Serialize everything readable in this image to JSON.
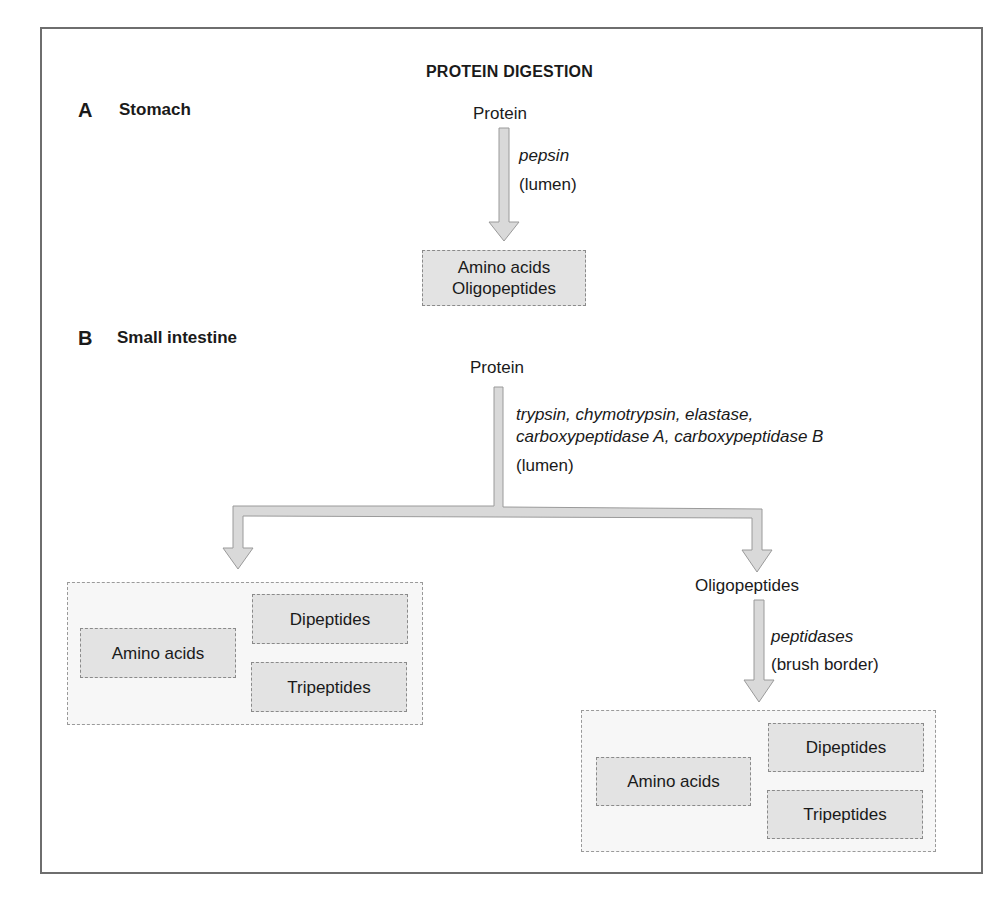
{
  "title": "PROTEIN DIGESTION",
  "colors": {
    "frame": "#6e6e6e",
    "arrow_fill": "#d9d9d9",
    "arrow_stroke": "#9a9a9a",
    "box_fill": "#e3e3e3",
    "group_fill": "#f7f7f7"
  },
  "section_a": {
    "letter": "A",
    "name": "Stomach",
    "substrate": "Protein",
    "enzyme": "pepsin",
    "location": "(lumen)",
    "products": [
      "Amino acids",
      "Oligopeptides"
    ]
  },
  "section_b": {
    "letter": "B",
    "name": "Small intestine",
    "substrate": "Protein",
    "enzymes_line1": "trypsin, chymotrypsin, elastase,",
    "enzymes_line2": "carboxypeptidase A, carboxypeptidase B",
    "location": "(lumen)",
    "left_products": {
      "amino_acids": "Amino acids",
      "dipeptides": "Dipeptides",
      "tripeptides": "Tripeptides"
    },
    "intermediate": "Oligopeptides",
    "second_enzyme": "peptidases",
    "second_location": "(brush border)",
    "right_products": {
      "amino_acids": "Amino acids",
      "dipeptides": "Dipeptides",
      "tripeptides": "Tripeptides"
    }
  }
}
